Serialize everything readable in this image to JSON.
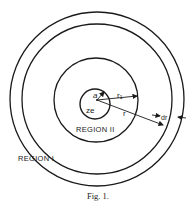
{
  "figure": {
    "caption": "Fig. 1.",
    "labels": {
      "region_outer": "REGION I",
      "region_inner": "REGION II",
      "charge": "ze",
      "radius_a": "a",
      "radius_r1": "r₁",
      "radius_r": "r",
      "shell_dr": "dr"
    },
    "colors": {
      "ink": "#1a1a1a",
      "background": "#ffffff"
    }
  }
}
